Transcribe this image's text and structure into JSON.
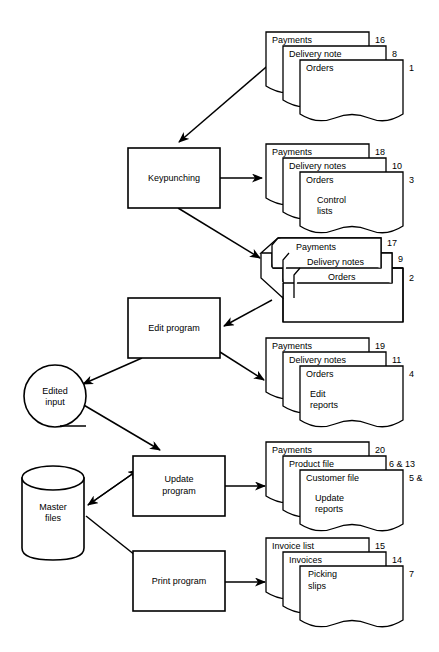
{
  "diagram": {
    "colors": {
      "stroke": "#000000",
      "background": "#ffffff"
    },
    "processes": [
      {
        "id": "keypunching",
        "label": "Keypunching",
        "x": 128,
        "y": 148,
        "w": 92,
        "h": 60
      },
      {
        "id": "edit-program",
        "label": "Edit program",
        "x": 128,
        "y": 298,
        "w": 92,
        "h": 60
      },
      {
        "id": "update-program",
        "label": "Update program",
        "line1": "Update",
        "line2": "program",
        "x": 133,
        "y": 456,
        "w": 92,
        "h": 60
      },
      {
        "id": "print-program",
        "label": "Print program",
        "x": 133,
        "y": 551,
        "w": 92,
        "h": 60
      }
    ],
    "storage": [
      {
        "id": "edited-input",
        "label": "Edited input",
        "line1": "Edited",
        "line2": "input",
        "shape": "circle",
        "cx": 55,
        "cy": 396,
        "r": 31
      },
      {
        "id": "master-files",
        "label": "Master files",
        "line1": "Master",
        "line2": "files",
        "shape": "cylinder",
        "x": 22,
        "y": 466,
        "w": 62,
        "h": 94
      }
    ],
    "carddeck": {
      "id": "card-deck-stack",
      "numbers": [
        "17",
        "9",
        "2"
      ],
      "labels": [
        "Payments",
        "Delivery notes",
        "Orders"
      ]
    },
    "docstacks": [
      {
        "id": "docs-source-input",
        "number_outer": "16",
        "numbers": [
          "16",
          "8",
          "1"
        ],
        "docs": [
          {
            "label": "Payments",
            "number": "16"
          },
          {
            "label": "Delivery note",
            "number": "8"
          },
          {
            "label": "Orders",
            "number": "1",
            "extra": ""
          }
        ]
      },
      {
        "id": "docs-keypunch-output",
        "numbers": [
          "18",
          "10",
          "3"
        ],
        "docs": [
          {
            "label": "Payments",
            "number": "18"
          },
          {
            "label": "Delivery notes",
            "number": "10"
          },
          {
            "label": "Orders",
            "number": "3",
            "extra_line1": "Control",
            "extra_line2": "lists"
          }
        ]
      },
      {
        "id": "docs-edit-output",
        "numbers": [
          "19",
          "11",
          "4"
        ],
        "docs": [
          {
            "label": "Payments",
            "number": "19"
          },
          {
            "label": "Delivery notes",
            "number": "11"
          },
          {
            "label": "Orders",
            "number": "4",
            "extra_line1": "Edit",
            "extra_line2": "reports"
          }
        ]
      },
      {
        "id": "docs-update-output",
        "numbers": [
          "20",
          "6 & 13",
          "5 &"
        ],
        "docs": [
          {
            "label": "Payments",
            "number": "20"
          },
          {
            "label": "Product file",
            "number": "6 & 13"
          },
          {
            "label": "Customer file",
            "number": "5 &",
            "extra_line1": "Update",
            "extra_line2": "reports"
          }
        ]
      },
      {
        "id": "docs-print-output",
        "numbers": [
          "15",
          "14",
          "7"
        ],
        "docs": [
          {
            "label": "Invoice list",
            "number": "15"
          },
          {
            "label": "Invoices",
            "number": "14"
          },
          {
            "label": "Picking slips",
            "number": "7",
            "line1": "Picking",
            "line2": "slips"
          }
        ]
      }
    ]
  }
}
